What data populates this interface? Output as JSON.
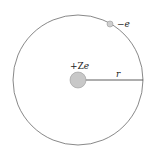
{
  "diagram": {
    "nucleus": {
      "label_prefix": "+Z",
      "label_suffix": "e",
      "color": "#c8c8c8",
      "stroke": "#999999"
    },
    "electron": {
      "label_prefix": "−",
      "label_suffix": "e",
      "color": "#cfcfcf",
      "stroke": "#999999"
    },
    "radius": {
      "label": "r"
    },
    "orbit": {
      "color": "#666666"
    }
  }
}
